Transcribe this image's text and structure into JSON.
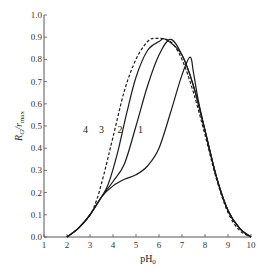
{
  "chart_data": {
    "type": "line",
    "title": "",
    "xlabel": "pH₀",
    "ylabel": "R_G / r_max",
    "xlim": [
      1,
      10
    ],
    "ylim": [
      0.0,
      1.0
    ],
    "grid": false,
    "legend": "inline curve labels",
    "x_ticks": [
      "1",
      "2",
      "3",
      "4",
      "5",
      "6",
      "7",
      "8",
      "9",
      "10"
    ],
    "y_ticks": [
      "0.0",
      "0.1",
      "0.2",
      "0.3",
      "0.4",
      "0.5",
      "0.6",
      "0.7",
      "0.8",
      "0.9",
      "1.0"
    ],
    "series": [
      {
        "name": "1",
        "style": "solid",
        "label_pos": [
          5.2,
          0.47
        ],
        "points": [
          [
            2.0,
            0.0
          ],
          [
            2.5,
            0.04
          ],
          [
            3.0,
            0.1
          ],
          [
            3.5,
            0.18
          ],
          [
            4.0,
            0.23
          ],
          [
            4.5,
            0.26
          ],
          [
            5.0,
            0.28
          ],
          [
            5.5,
            0.32
          ],
          [
            6.0,
            0.4
          ],
          [
            6.5,
            0.56
          ],
          [
            7.0,
            0.73
          ],
          [
            7.35,
            0.81
          ],
          [
            7.5,
            0.74
          ],
          [
            7.7,
            0.62
          ],
          [
            8.0,
            0.48
          ],
          [
            8.5,
            0.27
          ],
          [
            9.0,
            0.12
          ],
          [
            9.5,
            0.04
          ],
          [
            10.0,
            0.0
          ]
        ]
      },
      {
        "name": "2",
        "style": "solid",
        "label_pos": [
          4.3,
          0.47
        ],
        "points": [
          [
            2.0,
            0.0
          ],
          [
            2.5,
            0.04
          ],
          [
            3.0,
            0.1
          ],
          [
            3.5,
            0.18
          ],
          [
            4.0,
            0.25
          ],
          [
            4.5,
            0.33
          ],
          [
            5.0,
            0.5
          ],
          [
            5.5,
            0.68
          ],
          [
            6.0,
            0.82
          ],
          [
            6.5,
            0.89
          ],
          [
            7.0,
            0.82
          ],
          [
            7.5,
            0.68
          ],
          [
            8.0,
            0.48
          ],
          [
            8.5,
            0.27
          ],
          [
            9.0,
            0.12
          ],
          [
            9.5,
            0.04
          ],
          [
            10.0,
            0.0
          ]
        ]
      },
      {
        "name": "3",
        "style": "solid",
        "label_pos": [
          3.5,
          0.47
        ],
        "points": [
          [
            2.0,
            0.0
          ],
          [
            2.5,
            0.04
          ],
          [
            3.0,
            0.1
          ],
          [
            3.5,
            0.18
          ],
          [
            3.8,
            0.24
          ],
          [
            4.2,
            0.38
          ],
          [
            4.6,
            0.56
          ],
          [
            5.0,
            0.72
          ],
          [
            5.5,
            0.84
          ],
          [
            6.0,
            0.88
          ],
          [
            6.3,
            0.89
          ],
          [
            7.0,
            0.82
          ],
          [
            7.5,
            0.68
          ],
          [
            8.0,
            0.48
          ],
          [
            8.5,
            0.27
          ],
          [
            9.0,
            0.12
          ],
          [
            9.5,
            0.04
          ],
          [
            10.0,
            0.0
          ]
        ]
      },
      {
        "name": "4",
        "style": "dashed",
        "label_pos": [
          2.8,
          0.47
        ],
        "points": [
          [
            2.0,
            0.0
          ],
          [
            2.5,
            0.04
          ],
          [
            3.0,
            0.1
          ],
          [
            3.3,
            0.17
          ],
          [
            3.6,
            0.28
          ],
          [
            4.0,
            0.45
          ],
          [
            4.5,
            0.66
          ],
          [
            5.0,
            0.8
          ],
          [
            5.5,
            0.88
          ],
          [
            5.9,
            0.895
          ],
          [
            6.5,
            0.88
          ],
          [
            7.0,
            0.8
          ],
          [
            7.5,
            0.65
          ],
          [
            8.0,
            0.46
          ],
          [
            8.5,
            0.26
          ],
          [
            9.0,
            0.11
          ],
          [
            9.5,
            0.03
          ],
          [
            10.0,
            0.0
          ]
        ]
      }
    ]
  },
  "axes": {
    "xlabel_main": "pH",
    "xlabel_sub": "0",
    "ylabel_main": "R",
    "ylabel_sub1": "G",
    "ylabel_mid": "/r",
    "ylabel_sub2": "max"
  },
  "colors": {
    "line": "#1a1a1a",
    "axis": "#555555"
  }
}
